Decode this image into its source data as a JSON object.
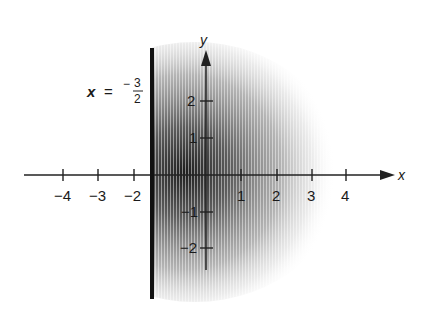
{
  "diagram": {
    "title": "",
    "boundary_line": {
      "label_lhs": "x",
      "label_eq": "=",
      "label_sign": "−",
      "label_num": "3",
      "label_den": "2",
      "x_value": -1.5
    },
    "axes": {
      "x_label": "x",
      "y_label": "y",
      "x_ticks": [
        "−4",
        "−3",
        "−2",
        "1",
        "2",
        "3",
        "4"
      ],
      "y_ticks": [
        "2",
        "1",
        "−1",
        "−2"
      ]
    },
    "shaded_region": {
      "description": "Half-disk of radius ~3 centered at origin, for x ≥ −3/2, darker near origin fading outward",
      "color": "#1a1a1a"
    }
  }
}
